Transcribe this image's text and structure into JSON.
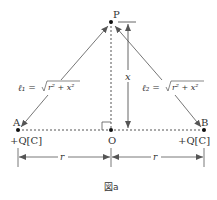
{
  "figure": {
    "caption": "図a",
    "points": {
      "P": {
        "label": "P",
        "x": 111,
        "y": 22
      },
      "A": {
        "label": "A",
        "x": 18,
        "y": 130,
        "charge": "+Q[C]"
      },
      "B": {
        "label": "B",
        "x": 204,
        "y": 130,
        "charge": "+Q[C]"
      },
      "O": {
        "label": "O",
        "x": 111,
        "y": 130
      }
    },
    "distances": {
      "l1": {
        "label": "ℓ₁ = ",
        "expr": "r² + x²"
      },
      "l2": {
        "label": "ℓ₂ = ",
        "expr": "r² + x²"
      },
      "x": "x",
      "r_left": "r",
      "r_right": "r"
    },
    "colors": {
      "line": "#555555",
      "text": "#333333",
      "point": "#111111"
    }
  }
}
